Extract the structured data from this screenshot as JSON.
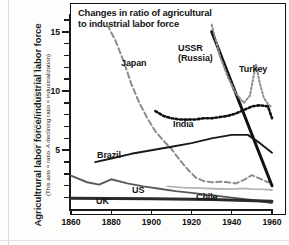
{
  "credit": "Third World Atlas, Open University 1994",
  "chart_data": {
    "type": "line",
    "title": "Changes in ratio of agricultural to industrial labor force",
    "title_line1": "Changes in ratio of agricultural",
    "title_line2": "to industrial labor force",
    "ylabel": "Agricultrural labor force/industrial labor force",
    "ylabel_sub": "(This axis = ratio. A declining ratio = industrialization)",
    "xlabel": "",
    "xlim": [
      1860,
      1960
    ],
    "ylim": [
      0,
      16.5
    ],
    "grid": false,
    "legend": "inline-labels",
    "xticks": [
      1860,
      1880,
      1900,
      1920,
      1940,
      1960
    ],
    "ytick_majors": [
      5,
      10,
      15
    ],
    "ytick_minors": [
      1,
      2,
      3,
      4,
      6,
      7,
      8,
      9,
      11,
      12,
      13,
      14,
      16
    ],
    "series": [
      {
        "name": "Japan",
        "style": "dashed",
        "color": "#8c8c8c",
        "label_x": 121,
        "label_y": 58,
        "points": [
          [
            1878,
            15.6
          ],
          [
            1882,
            14.3
          ],
          [
            1886,
            12.6
          ],
          [
            1890,
            10.6
          ],
          [
            1894,
            9.0
          ],
          [
            1898,
            7.7
          ],
          [
            1902,
            6.6
          ],
          [
            1906,
            5.8
          ],
          [
            1910,
            5.1
          ],
          [
            1914,
            4.2
          ],
          [
            1918,
            3.4
          ],
          [
            1922,
            2.7
          ],
          [
            1926,
            2.4
          ],
          [
            1930,
            2.3
          ],
          [
            1934,
            2.35
          ],
          [
            1938,
            2.3
          ],
          [
            1942,
            2.2
          ],
          [
            1946,
            2.5
          ],
          [
            1950,
            2.9
          ],
          [
            1954,
            2.6
          ],
          [
            1958,
            2.3
          ],
          [
            1960,
            2.6
          ]
        ]
      },
      {
        "name": "USSR (Russia)",
        "label_line1": "USSR",
        "label_line2": "(Russia)",
        "style": "solid-thick",
        "color": "#111111",
        "label_x": 178,
        "label_y": 44,
        "points": [
          [
            1930,
            15.0
          ],
          [
            1960,
            2.0
          ]
        ]
      },
      {
        "name": "Turkey",
        "style": "dotted",
        "color": "#8f8f8f",
        "label_x": 239,
        "label_y": 64,
        "points": [
          [
            1930,
            15.6
          ],
          [
            1934,
            13.0
          ],
          [
            1938,
            11.2
          ],
          [
            1942,
            9.8
          ],
          [
            1946,
            9.0
          ],
          [
            1949,
            9.6
          ],
          [
            1952,
            12.3
          ],
          [
            1954,
            10.6
          ],
          [
            1956,
            9.4
          ],
          [
            1958,
            8.9
          ],
          [
            1960,
            8.6
          ]
        ]
      },
      {
        "name": "India",
        "style": "dotted-thick",
        "color": "#111111",
        "label_x": 173,
        "label_y": 119,
        "points": [
          [
            1902,
            8.3
          ],
          [
            1906,
            7.9
          ],
          [
            1910,
            7.7
          ],
          [
            1914,
            7.6
          ],
          [
            1918,
            7.6
          ],
          [
            1922,
            7.6
          ],
          [
            1926,
            7.7
          ],
          [
            1930,
            7.7
          ],
          [
            1934,
            7.8
          ],
          [
            1938,
            7.9
          ],
          [
            1942,
            8.1
          ],
          [
            1946,
            8.4
          ],
          [
            1950,
            8.7
          ],
          [
            1954,
            8.8
          ],
          [
            1958,
            8.7
          ],
          [
            1960,
            7.7
          ]
        ]
      },
      {
        "name": "Brazil",
        "style": "solid",
        "color": "#1a1a1a",
        "label_x": 97,
        "label_y": 150,
        "points": [
          [
            1872,
            4.0
          ],
          [
            1880,
            4.3
          ],
          [
            1890,
            4.7
          ],
          [
            1900,
            5.0
          ],
          [
            1910,
            5.3
          ],
          [
            1920,
            5.6
          ],
          [
            1930,
            6.0
          ],
          [
            1940,
            6.3
          ],
          [
            1948,
            6.3
          ],
          [
            1954,
            5.6
          ],
          [
            1960,
            4.8
          ]
        ]
      },
      {
        "name": "US",
        "style": "solid",
        "color": "#5a5a5a",
        "label_x": 132,
        "label_y": 185,
        "points": [
          [
            1860,
            2.85
          ],
          [
            1868,
            2.3
          ],
          [
            1874,
            2.1
          ],
          [
            1880,
            2.55
          ],
          [
            1888,
            2.2
          ],
          [
            1896,
            1.95
          ],
          [
            1904,
            1.75
          ],
          [
            1912,
            1.55
          ],
          [
            1920,
            1.4
          ],
          [
            1930,
            1.2
          ],
          [
            1940,
            1.0
          ],
          [
            1950,
            0.8
          ],
          [
            1960,
            0.55
          ]
        ]
      },
      {
        "name": "Chile",
        "style": "solid",
        "color": "#b4b4b4",
        "label_x": 196,
        "label_y": 192,
        "points": [
          [
            1908,
            1.95
          ],
          [
            1916,
            1.85
          ],
          [
            1924,
            1.8
          ],
          [
            1932,
            1.75
          ],
          [
            1940,
            1.72
          ],
          [
            1946,
            1.78
          ],
          [
            1950,
            1.72
          ],
          [
            1956,
            1.7
          ],
          [
            1960,
            1.65
          ]
        ]
      },
      {
        "name": "UK",
        "style": "solid-thick",
        "color": "#2b2b2b",
        "label_x": 96,
        "label_y": 196,
        "points": [
          [
            1860,
            0.95
          ],
          [
            1900,
            0.9
          ],
          [
            1930,
            0.85
          ],
          [
            1960,
            0.7
          ]
        ]
      }
    ]
  }
}
